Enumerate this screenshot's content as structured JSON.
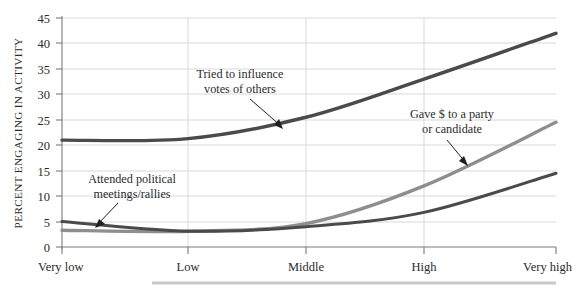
{
  "chart_data": {
    "type": "line",
    "title": "",
    "xlabel": "",
    "ylabel": "PERCENT ENGAGING IN ACTIVITY",
    "categories": [
      "Very low",
      "Low",
      "Middle",
      "High",
      "Very high"
    ],
    "ylim": [
      0,
      45
    ],
    "ytick_labels": [
      "0",
      "5",
      "10",
      "15",
      "20",
      "25",
      "30",
      "35",
      "40",
      "45"
    ],
    "ytick_values": [
      0,
      5,
      10,
      15,
      20,
      25,
      30,
      35,
      40,
      45
    ],
    "grid": true,
    "legend_position": "inline-annotations",
    "series": [
      {
        "name": "Tried to influence votes of others",
        "color": "#4a4a4a",
        "width": 3.4,
        "values": [
          21,
          21.3,
          25.5,
          33,
          42
        ]
      },
      {
        "name": "Gave $ to a party or candidate",
        "color": "#8e8e92",
        "width": 3.4,
        "values": [
          3.3,
          3.1,
          4.6,
          12,
          24.5
        ]
      },
      {
        "name": "Attended political meetings/rallies",
        "color": "#4a4a4a",
        "width": 3.0,
        "values": [
          5,
          3.1,
          4,
          6.8,
          14.5
        ]
      }
    ],
    "annotations": [
      {
        "name": "influence-votes",
        "lines": [
          "Tried to influence",
          "votes of others"
        ],
        "series": "Tried to influence votes of others"
      },
      {
        "name": "gave-money",
        "lines": [
          "Gave $ to a party",
          "or candidate"
        ],
        "series": "Gave $ to a party or candidate"
      },
      {
        "name": "attended-meetings",
        "lines": [
          "Attended political",
          "meetings/rallies"
        ],
        "series": "Attended political meetings/rallies"
      }
    ]
  }
}
